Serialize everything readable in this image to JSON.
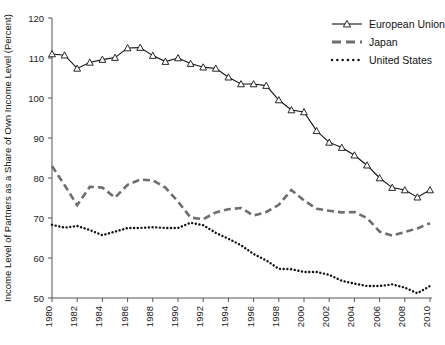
{
  "chart_data": {
    "type": "line",
    "title": "",
    "xlabel": "",
    "ylabel": "Income Level of Partners as a Share of Own Income Level (Percent)",
    "xlim": [
      1980,
      2010
    ],
    "ylim": [
      50,
      120
    ],
    "yticks": [
      50,
      60,
      70,
      80,
      90,
      100,
      110,
      120
    ],
    "xticks": [
      1980,
      1982,
      1984,
      1986,
      1988,
      1990,
      1992,
      1994,
      1996,
      1998,
      2000,
      2002,
      2004,
      2006,
      2008,
      2010
    ],
    "grid": false,
    "legend_position": "top-right",
    "x": [
      1980,
      1981,
      1982,
      1983,
      1984,
      1985,
      1986,
      1987,
      1988,
      1989,
      1990,
      1991,
      1992,
      1993,
      1994,
      1995,
      1996,
      1997,
      1998,
      1999,
      2000,
      2001,
      2002,
      2003,
      2004,
      2005,
      2006,
      2007,
      2008,
      2009,
      2010
    ],
    "series": [
      {
        "name": "European Union",
        "style": "solid-triangle",
        "color": "#111111",
        "values": [
          111.0,
          110.7,
          107.4,
          108.9,
          109.6,
          110.1,
          112.5,
          112.6,
          110.6,
          109.1,
          110.0,
          108.6,
          107.7,
          107.4,
          105.2,
          103.5,
          103.5,
          103.1,
          99.5,
          97.0,
          96.5,
          91.8,
          88.9,
          87.6,
          85.7,
          83.2,
          80.0,
          77.6,
          77.0,
          75.2,
          77.0
        ]
      },
      {
        "name": "Japan",
        "style": "dashed",
        "color": "#6e6e6e",
        "values": [
          83.0,
          78.2,
          73.2,
          77.8,
          77.6,
          75.1,
          78.3,
          79.6,
          79.4,
          77.6,
          74.1,
          70.1,
          69.7,
          71.4,
          72.2,
          72.5,
          70.6,
          71.5,
          73.3,
          77.0,
          74.4,
          72.3,
          71.8,
          71.4,
          71.5,
          70.0,
          66.6,
          65.6,
          66.5,
          67.4,
          68.7
        ]
      },
      {
        "name": "United States",
        "style": "dotted",
        "color": "#111111",
        "values": [
          68.3,
          67.6,
          68.0,
          67.0,
          65.7,
          66.6,
          67.5,
          67.5,
          67.7,
          67.5,
          67.5,
          68.8,
          68.2,
          66.3,
          64.8,
          63.2,
          61.0,
          59.4,
          57.3,
          57.2,
          56.5,
          56.5,
          55.8,
          54.3,
          53.6,
          53.0,
          53.0,
          53.4,
          52.6,
          51.2,
          53.0
        ]
      }
    ]
  },
  "legend": {
    "items": [
      {
        "label": "European Union",
        "key": "eu"
      },
      {
        "label": "Japan",
        "key": "japan"
      },
      {
        "label": "United States",
        "key": "us"
      }
    ]
  },
  "axes": {
    "y_title": "Income Level of Partners as a Share of Own Income Level (Percent)"
  }
}
